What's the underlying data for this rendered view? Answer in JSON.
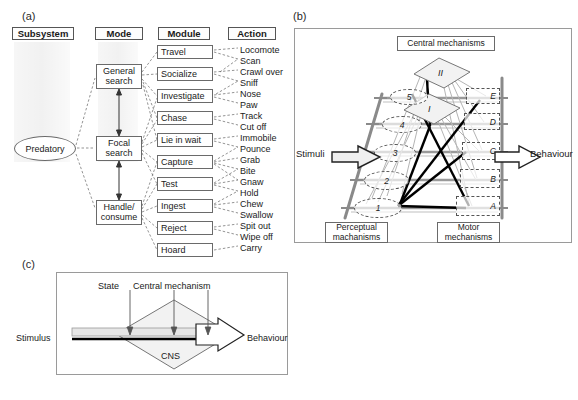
{
  "figure": {
    "panels": [
      {
        "id": "a",
        "letter": "(a)"
      },
      {
        "id": "b",
        "letter": "(b)"
      },
      {
        "id": "c",
        "letter": "(c)"
      }
    ]
  },
  "panel_a": {
    "column_headers": [
      {
        "label": "Subsystem"
      },
      {
        "label": "Mode"
      },
      {
        "label": "Module"
      },
      {
        "label": "Action"
      }
    ],
    "subsystem": {
      "label": "Predatory"
    },
    "modes": [
      {
        "label": "General\nsearch",
        "line1": "General",
        "line2": "search"
      },
      {
        "label": "Focal\nsearch",
        "line1": "Focal",
        "line2": "search"
      },
      {
        "label": "Handle/\nconsume",
        "line1": "Handle/",
        "line2": "consume"
      }
    ],
    "modules": [
      {
        "label": "Travel"
      },
      {
        "label": "Socialize"
      },
      {
        "label": "Investigate"
      },
      {
        "label": "Chase"
      },
      {
        "label": "Lie in wait"
      },
      {
        "label": "Capture"
      },
      {
        "label": "Test"
      },
      {
        "label": "Ingest"
      },
      {
        "label": "Reject"
      },
      {
        "label": "Hoard"
      }
    ],
    "actions": [
      {
        "label": "Locomote"
      },
      {
        "label": "Scan"
      },
      {
        "label": "Crawl over"
      },
      {
        "label": "Sniff"
      },
      {
        "label": "Nose"
      },
      {
        "label": "Paw"
      },
      {
        "label": "Track"
      },
      {
        "label": "Cut off"
      },
      {
        "label": "Immobile"
      },
      {
        "label": "Pounce"
      },
      {
        "label": "Grab"
      },
      {
        "label": "Bite"
      },
      {
        "label": "Gnaw"
      },
      {
        "label": "Hold"
      },
      {
        "label": "Chew"
      },
      {
        "label": "Swallow"
      },
      {
        "label": "Spit out"
      },
      {
        "label": "Wipe off"
      },
      {
        "label": "Carry"
      }
    ]
  },
  "panel_b": {
    "central_mechanisms_label": "Central mechanisms",
    "perceptual_label_line1": "Perceptual",
    "perceptual_label_line2": "machanisms",
    "motor_label_line1": "Motor",
    "motor_label_line2": "mechanisms",
    "stimuli_label": "Stimuli",
    "behaviour_label": "Behaviour",
    "central_nodes": [
      {
        "label": "II"
      },
      {
        "label": "I"
      }
    ],
    "perceptual_nodes": [
      {
        "label": "5"
      },
      {
        "label": "4"
      },
      {
        "label": "3"
      },
      {
        "label": "2"
      },
      {
        "label": "1"
      }
    ],
    "motor_nodes": [
      {
        "label": "E"
      },
      {
        "label": "D"
      },
      {
        "label": "C"
      },
      {
        "label": "B"
      },
      {
        "label": "A"
      }
    ]
  },
  "panel_c": {
    "state_label": "State",
    "central_mechanism_label": "Central mechanism",
    "stimulus_label": "Stimulus",
    "behaviour_label": "Behaviour",
    "cns_label": "CNS"
  },
  "colors": {
    "ink": "#1a1a1a",
    "frame": "#9a9a9a",
    "box_border": "#6a6a6a",
    "dashed": "#555555",
    "heavy_link": "#000000"
  }
}
